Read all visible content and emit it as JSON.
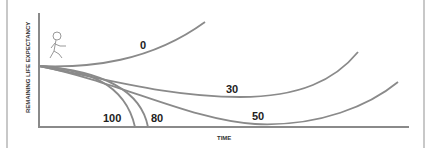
{
  "diagram": {
    "y_axis_label": "REMAINING LIFE EXPECTANCY",
    "x_axis_label": "TIME",
    "icon": "running-person-icon",
    "curves": [
      {
        "label": "0"
      },
      {
        "label": "30"
      },
      {
        "label": "50"
      },
      {
        "label": "80"
      },
      {
        "label": "100"
      }
    ],
    "colors": {
      "curve": "#8a8a8a",
      "axis": "#8a8a8a",
      "text": "#222222"
    }
  }
}
